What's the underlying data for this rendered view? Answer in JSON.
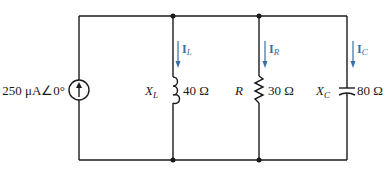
{
  "source": {
    "type": "current-source",
    "label": "250 μA∠0°"
  },
  "branches": [
    {
      "component": "inductor",
      "name_main": "X",
      "name_sub": "L",
      "value": "40 Ω",
      "current_main": "I",
      "current_sub": "L"
    },
    {
      "component": "resistor",
      "name_main": "R",
      "name_sub": "",
      "value": "30 Ω",
      "current_main": "I",
      "current_sub": "R"
    },
    {
      "component": "capacitor",
      "name_main": "X",
      "name_sub": "C",
      "value": "80 Ω",
      "current_main": "I",
      "current_sub": "C"
    }
  ],
  "colors": {
    "wire": "#1a1a1a",
    "current_arrow": "#3a6ea5"
  }
}
